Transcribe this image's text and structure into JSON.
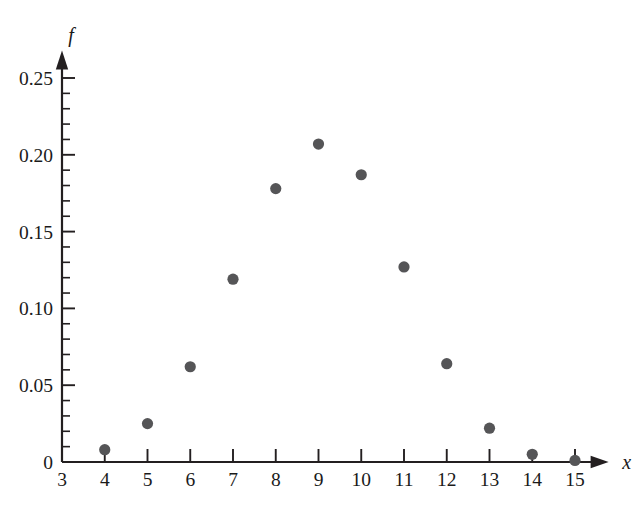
{
  "chart_data": {
    "type": "scatter",
    "title": "",
    "subtitle": "",
    "xlabel": "x",
    "ylabel": "f",
    "x": [
      4,
      5,
      6,
      7,
      8,
      9,
      10,
      11,
      12,
      13,
      14,
      15
    ],
    "values": [
      0.008,
      0.025,
      0.062,
      0.119,
      0.178,
      0.207,
      0.187,
      0.127,
      0.064,
      0.022,
      0.005,
      0.001
    ],
    "series": [
      {
        "name": "f",
        "points": [
          {
            "x": 4,
            "y": 0.008
          },
          {
            "x": 5,
            "y": 0.025
          },
          {
            "x": 6,
            "y": 0.062
          },
          {
            "x": 7,
            "y": 0.119
          },
          {
            "x": 8,
            "y": 0.178
          },
          {
            "x": 9,
            "y": 0.207
          },
          {
            "x": 10,
            "y": 0.187
          },
          {
            "x": 11,
            "y": 0.127
          },
          {
            "x": 12,
            "y": 0.064
          },
          {
            "x": 13,
            "y": 0.022
          },
          {
            "x": 14,
            "y": 0.005
          },
          {
            "x": 15,
            "y": 0.001
          }
        ]
      }
    ],
    "xlim": [
      3,
      15.6
    ],
    "ylim": [
      0,
      0.262
    ],
    "x_ticks": [
      3,
      4,
      5,
      6,
      7,
      8,
      9,
      10,
      11,
      12,
      13,
      14,
      15
    ],
    "x_tick_labels": [
      "3",
      "4",
      "5",
      "6",
      "7",
      "8",
      "9",
      "10",
      "11",
      "12",
      "13",
      "14",
      "15"
    ],
    "y_ticks": [
      0,
      0.05,
      0.1,
      0.15,
      0.2,
      0.25
    ],
    "y_tick_labels": [
      "0",
      "0.05",
      "0.10",
      "0.15",
      "0.20",
      "0.25"
    ],
    "y_minor_tick_step": 0.01,
    "grid": false,
    "legend": false,
    "legend_position": "none",
    "marker": "filled-circle",
    "marker_color": "#555557",
    "axis_color": "#231f20",
    "background_color": "#ffffff",
    "axis_arrows": true
  },
  "axis": {
    "y_label": "f",
    "x_label": "x"
  }
}
